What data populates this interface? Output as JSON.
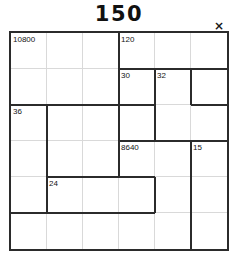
{
  "title": "150",
  "close": {
    "icon": "close-icon",
    "label": "×"
  },
  "colors": {
    "cage_border": "#2b2b2b",
    "cell_grid": "#d9d9d9",
    "text": "#141414",
    "background": "#ffffff"
  },
  "grid": {
    "columns": 6,
    "rows": 6,
    "cell_size": 36
  },
  "cages": [
    {
      "name": "cage-10800",
      "label": "10800",
      "col": 0,
      "row": 0
    },
    {
      "name": "cage-120",
      "label": "120",
      "col": 3,
      "row": 0
    },
    {
      "name": "cage-30",
      "label": "30",
      "col": 3,
      "row": 1
    },
    {
      "name": "cage-32",
      "label": "32",
      "col": 4,
      "row": 1
    },
    {
      "name": "cage-36",
      "label": "36",
      "col": 0,
      "row": 2
    },
    {
      "name": "cage-8640",
      "label": "8640",
      "col": 3,
      "row": 3
    },
    {
      "name": "cage-15",
      "label": "15",
      "col": 5,
      "row": 3
    },
    {
      "name": "cage-24",
      "label": "24",
      "col": 1,
      "row": 4
    }
  ],
  "cage_edges": {
    "horizontal": [
      {
        "col": 0,
        "row": 2,
        "span": 1
      },
      {
        "col": 1,
        "row": 2,
        "span": 1
      },
      {
        "col": 2,
        "row": 2,
        "span": 1
      },
      {
        "col": 3,
        "row": 1,
        "span": 1
      },
      {
        "col": 4,
        "row": 1,
        "span": 1
      },
      {
        "col": 5,
        "row": 1,
        "span": 1
      },
      {
        "col": 2,
        "row": 2,
        "span": 2
      },
      {
        "col": 5,
        "row": 2,
        "span": 1
      },
      {
        "col": 4,
        "row": 3,
        "span": 1
      },
      {
        "col": 3,
        "row": 3,
        "span": 1
      },
      {
        "col": 5,
        "row": 3,
        "span": 1
      },
      {
        "col": 1,
        "row": 4,
        "span": 1
      },
      {
        "col": 2,
        "row": 4,
        "span": 1
      },
      {
        "col": 3,
        "row": 4,
        "span": 1
      },
      {
        "col": 0,
        "row": 5,
        "span": 1
      },
      {
        "col": 1,
        "row": 5,
        "span": 1
      },
      {
        "col": 2,
        "row": 5,
        "span": 1
      },
      {
        "col": 3,
        "row": 5,
        "span": 1
      }
    ],
    "vertical": [
      {
        "col": 3,
        "row": 0,
        "span": 1
      },
      {
        "col": 3,
        "row": 1,
        "span": 1
      },
      {
        "col": 4,
        "row": 1,
        "span": 1
      },
      {
        "col": 5,
        "row": 1,
        "span": 1
      },
      {
        "col": 1,
        "row": 2,
        "span": 1
      },
      {
        "col": 3,
        "row": 2,
        "span": 1
      },
      {
        "col": 4,
        "row": 2,
        "span": 1
      },
      {
        "col": 1,
        "row": 3,
        "span": 1
      },
      {
        "col": 3,
        "row": 3,
        "span": 1
      },
      {
        "col": 5,
        "row": 3,
        "span": 1
      },
      {
        "col": 1,
        "row": 4,
        "span": 1
      },
      {
        "col": 5,
        "row": 4,
        "span": 1
      },
      {
        "col": 4,
        "row": 4,
        "span": 1
      },
      {
        "col": 5,
        "row": 5,
        "span": 1
      }
    ]
  }
}
